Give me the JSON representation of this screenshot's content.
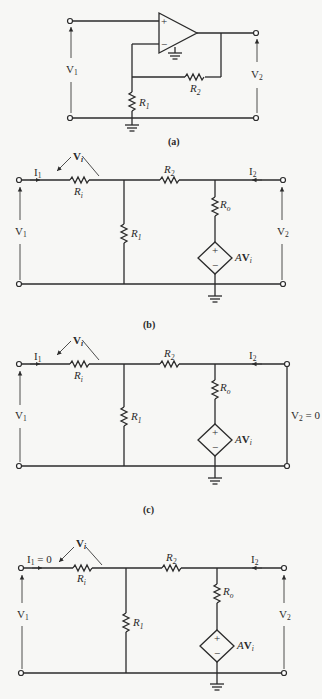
{
  "figure": {
    "panels": [
      {
        "id": "a",
        "caption": "(a)",
        "description": "Non-inverting op-amp amplifier",
        "labels": {
          "v_in": "V",
          "v_in_sub": "1",
          "v_out": "V",
          "v_out_sub": "2",
          "r1": "R",
          "r1_sub": "1",
          "r2": "R",
          "r2_sub": "2",
          "plus": "+",
          "minus": "−"
        }
      },
      {
        "id": "b",
        "caption": "(b)",
        "description": "Equivalent circuit with op-amp model",
        "labels": {
          "i1": "I",
          "i1_sub": "1",
          "i1_suffix": "",
          "i2": "I",
          "i2_sub": "2",
          "vi": "V",
          "vi_sub": "i",
          "ri": "R",
          "ri_sub": "i",
          "r1": "R",
          "r1_sub": "1",
          "r2": "R",
          "r2_sub": "2",
          "ro": "R",
          "ro_sub": "o",
          "src_gain": "A",
          "src_v": "V",
          "src_v_sub": "i",
          "v_in": "V",
          "v_in_sub": "1",
          "v_out": "V",
          "v_out_sub": "2",
          "v_out_suffix": "",
          "plus": "+",
          "minus": "−"
        }
      },
      {
        "id": "c",
        "caption": "(c)",
        "description": "Equivalent circuit with output shorted",
        "labels": {
          "i1": "I",
          "i1_sub": "1",
          "i1_suffix": "",
          "i2": "I",
          "i2_sub": "2",
          "vi": "V",
          "vi_sub": "i",
          "ri": "R",
          "ri_sub": "i",
          "r1": "R",
          "r1_sub": "1",
          "r2": "R",
          "r2_sub": "2",
          "ro": "R",
          "ro_sub": "o",
          "src_gain": "A",
          "src_v": "V",
          "src_v_sub": "i",
          "v_in": "V",
          "v_in_sub": "1",
          "v_out": "V",
          "v_out_sub": "2",
          "v_out_suffix": " = 0",
          "plus": "+",
          "minus": "−"
        }
      },
      {
        "id": "d",
        "caption": "",
        "description": "Equivalent circuit with input open",
        "labels": {
          "i1": "I",
          "i1_sub": "1",
          "i1_suffix": " = 0",
          "i2": "I",
          "i2_sub": "2",
          "vi": "V",
          "vi_sub": "i",
          "ri": "R",
          "ri_sub": "i",
          "r1": "R",
          "r1_sub": "1",
          "r2": "R",
          "r2_sub": "2",
          "ro": "R",
          "ro_sub": "o",
          "src_gain": "A",
          "src_v": "V",
          "src_v_sub": "i",
          "v_in": "V",
          "v_in_sub": "1",
          "v_out": "V",
          "v_out_sub": "2",
          "v_out_suffix": "",
          "plus": "+",
          "minus": "−"
        }
      }
    ]
  }
}
